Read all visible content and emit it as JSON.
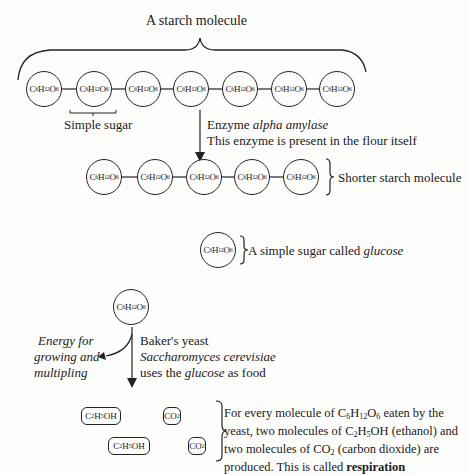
{
  "title": "A starch molecule",
  "starch_chain": {
    "units": [
      "C6H12O6",
      "C6H12O6",
      "C6H12O6",
      "C6H12O6",
      "C6H12O6",
      "C6H12O6",
      "C6H12O6"
    ],
    "simple_sugar_label": "Simple sugar"
  },
  "enzyme_step": {
    "line1_prefix": "Enzyme ",
    "line1_italic": "alpha amylase",
    "line2": "This enzyme is present in the flour itself"
  },
  "shorter_chain": {
    "units": [
      "C6H12O6",
      "C6H12O6",
      "C6H12O6",
      "C6H12O6",
      "C6H12O6"
    ],
    "label": "Shorter starch molecule"
  },
  "glucose": {
    "unit": "C6H12O6",
    "label_prefix": "A simple sugar called ",
    "label_italic": "glucose"
  },
  "yeast_step": {
    "line1": "Baker's yeast",
    "line2_italic": "Saccharomyces cerevisiae",
    "line3_prefix": "uses the ",
    "line3_italic": "glucose",
    "line3_suffix": " as food",
    "energy_label": [
      "Energy for",
      "growing and",
      "multipling"
    ]
  },
  "products": {
    "ethanol": "C2H5OH",
    "co2": "CO2",
    "description_parts": {
      "p1": "For every molecule of C",
      "p2": " eaten by the yeast, two molecules of C",
      "p3": "OH (ethanol) and two molecules of CO",
      "p4": " (carbon dioxide) are produced. This is called ",
      "bold": "respiration"
    }
  }
}
